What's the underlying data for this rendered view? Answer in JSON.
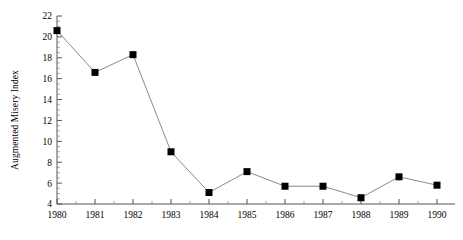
{
  "chart_data": {
    "type": "line",
    "title": "",
    "xlabel": "",
    "ylabel": "Augmented Misery Index",
    "categories": [
      "1980",
      "1981",
      "1982",
      "1983",
      "1984",
      "1985",
      "1986",
      "1987",
      "1988",
      "1989",
      "1990"
    ],
    "x": [
      1980,
      1981,
      1982,
      1983,
      1984,
      1985,
      1986,
      1987,
      1988,
      1989,
      1990
    ],
    "values": [
      20.6,
      16.6,
      18.3,
      9.0,
      5.1,
      7.1,
      5.7,
      5.7,
      4.6,
      6.6,
      5.8
    ],
    "series": [
      {
        "name": "Augmented Misery Index",
        "values": [
          20.6,
          16.6,
          18.3,
          9.0,
          5.1,
          7.1,
          5.7,
          5.7,
          4.6,
          6.6,
          5.8
        ]
      }
    ],
    "xlim": [
      1980,
      1990
    ],
    "ylim": [
      4,
      22
    ],
    "ytick_labels": [
      "22",
      "20",
      "18",
      "16",
      "14",
      "12",
      "10",
      "8",
      "6",
      "4"
    ],
    "yticks": [
      22,
      20,
      18,
      16,
      14,
      12,
      10,
      8,
      6,
      4
    ],
    "yminor_step": 0.5,
    "xtick_labels": [
      "1980",
      "1981",
      "1982",
      "1983",
      "1984",
      "1985",
      "1986",
      "1987",
      "1988",
      "1989",
      "1990"
    ],
    "grid": false,
    "legend": false,
    "legend_position": "none",
    "marker": "square",
    "marker_color": "#000000",
    "line_color": "#8a8a8a",
    "axis_color": "#555555"
  }
}
